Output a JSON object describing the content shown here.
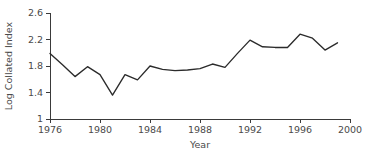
{
  "chart_data": {
    "type": "line",
    "title": "",
    "xlabel": "Year",
    "ylabel": "Log Collated Index",
    "xlim": [
      1976,
      2000
    ],
    "ylim": [
      1.0,
      2.6
    ],
    "grid": false,
    "legend": null,
    "x_ticks": [
      "1976",
      "1980",
      "1984",
      "1988",
      "1992",
      "1996",
      "2000"
    ],
    "x_tick_values": [
      1976,
      1980,
      1984,
      1988,
      1992,
      1996,
      2000
    ],
    "y_ticks": [
      "1",
      "1.4",
      "1.8",
      "2.2",
      "2.6"
    ],
    "y_tick_values": [
      1.0,
      1.4,
      1.8,
      2.2,
      2.6
    ],
    "line_color": "#2b2b2b",
    "axis_color": "#3a3a3a",
    "background_color": "#ffffff",
    "series": [
      {
        "name": "Log Collated Index",
        "x": [
          1976,
          1977,
          1978,
          1979,
          1980,
          1981,
          1982,
          1983,
          1984,
          1985,
          1986,
          1987,
          1988,
          1989,
          1990,
          1991,
          1992,
          1993,
          1994,
          1995,
          1996,
          1997,
          1998,
          1999
        ],
        "values": [
          1.99,
          1.82,
          1.64,
          1.79,
          1.67,
          1.36,
          1.67,
          1.59,
          1.8,
          1.75,
          1.73,
          1.74,
          1.76,
          1.83,
          1.78,
          1.99,
          2.19,
          2.09,
          2.08,
          2.08,
          2.28,
          2.22,
          2.04,
          2.15
        ]
      }
    ]
  }
}
